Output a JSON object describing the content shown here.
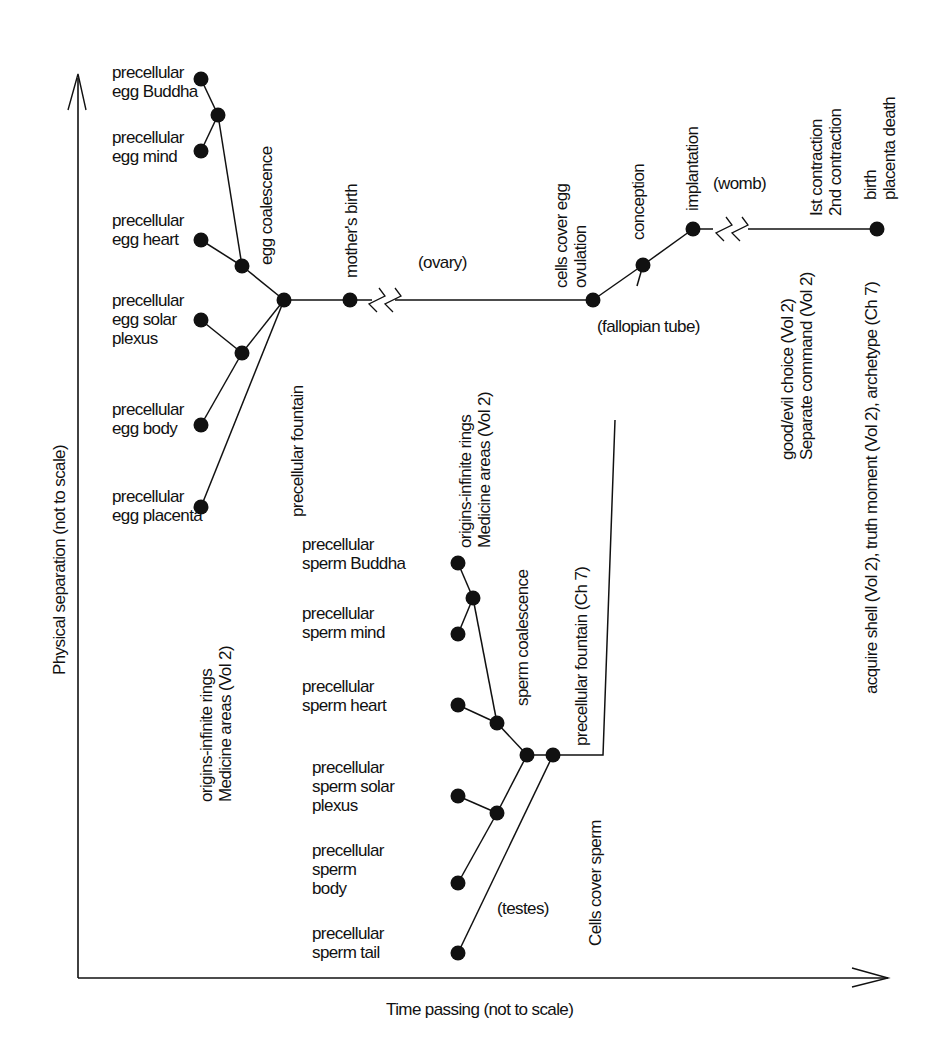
{
  "axes": {
    "y_label": "Physical separation (not to scale)",
    "x_label": "Time passing (not to scale)"
  },
  "nodes": [
    {
      "id": "eggBuddha",
      "x": 201,
      "y": 79
    },
    {
      "id": "eggM1",
      "x": 218,
      "y": 115
    },
    {
      "id": "eggMind",
      "x": 201,
      "y": 151
    },
    {
      "id": "eggHeart",
      "x": 201,
      "y": 240
    },
    {
      "id": "eggCoal",
      "x": 242,
      "y": 266
    },
    {
      "id": "eggFount",
      "x": 284,
      "y": 300
    },
    {
      "id": "eggSolar",
      "x": 201,
      "y": 320
    },
    {
      "id": "eggM2",
      "x": 242,
      "y": 353
    },
    {
      "id": "eggBody",
      "x": 201,
      "y": 425
    },
    {
      "id": "eggPlacenta",
      "x": 201,
      "y": 507
    },
    {
      "id": "mother",
      "x": 350,
      "y": 300
    },
    {
      "id": "ovulation",
      "x": 593,
      "y": 300
    },
    {
      "id": "conception",
      "x": 643,
      "y": 265
    },
    {
      "id": "implant",
      "x": 693,
      "y": 229
    },
    {
      "id": "birth",
      "x": 877,
      "y": 229
    },
    {
      "id": "spBuddha",
      "x": 458,
      "y": 563
    },
    {
      "id": "spM1",
      "x": 473,
      "y": 598
    },
    {
      "id": "spMind",
      "x": 458,
      "y": 634
    },
    {
      "id": "spHeart",
      "x": 458,
      "y": 705
    },
    {
      "id": "spCoal",
      "x": 497,
      "y": 723
    },
    {
      "id": "spA",
      "x": 527,
      "y": 755
    },
    {
      "id": "spB",
      "x": 553,
      "y": 755
    },
    {
      "id": "spSolar",
      "x": 458,
      "y": 796
    },
    {
      "id": "spM2",
      "x": 497,
      "y": 813
    },
    {
      "id": "spBody",
      "x": 458,
      "y": 883
    },
    {
      "id": "spTail",
      "x": 458,
      "y": 953
    }
  ],
  "edges": [
    [
      "eggBuddha",
      "eggM1"
    ],
    [
      "eggMind",
      "eggM1"
    ],
    [
      "eggM1",
      "eggCoal"
    ],
    [
      "eggHeart",
      "eggCoal"
    ],
    [
      "eggCoal",
      "eggFount"
    ],
    [
      "eggSolar",
      "eggM2"
    ],
    [
      "eggBody",
      "eggM2"
    ],
    [
      "eggM2",
      "eggFount"
    ],
    [
      "eggPlacenta",
      "eggFount"
    ],
    [
      "eggFount",
      "mother"
    ],
    [
      "ovulation",
      "conception"
    ],
    [
      "conception",
      "implant"
    ],
    [
      "spBuddha",
      "spM1"
    ],
    [
      "spMind",
      "spM1"
    ],
    [
      "spM1",
      "spCoal"
    ],
    [
      "spHeart",
      "spCoal"
    ],
    [
      "spCoal",
      "spA"
    ],
    [
      "spSolar",
      "spM2"
    ],
    [
      "spBody",
      "spM2"
    ],
    [
      "spM2",
      "spA"
    ],
    [
      "spA",
      "spB"
    ],
    [
      "spTail",
      "spB"
    ]
  ],
  "polylines": [
    {
      "name": "ovary-line",
      "points": "350,300 372,300"
    },
    {
      "name": "ovary-line-2",
      "points": "395,300 593,300"
    },
    {
      "name": "womb-line",
      "points": "693,229 713,229"
    },
    {
      "name": "womb-line-2",
      "points": "748,229 877,229"
    },
    {
      "name": "sperm-to-conception",
      "points": "553,755 603,755 615,420"
    },
    {
      "name": "fallopian-to-conception",
      "points": "637,286 643,265"
    }
  ],
  "labels_h": [
    {
      "x": 112,
      "y": 78,
      "lines": [
        "precellular",
        "egg Buddha"
      ]
    },
    {
      "x": 112,
      "y": 143,
      "lines": [
        "precellular",
        "egg mind"
      ]
    },
    {
      "x": 112,
      "y": 226,
      "lines": [
        "precellular",
        "egg heart"
      ]
    },
    {
      "x": 112,
      "y": 306,
      "lines": [
        "precellular",
        "egg solar",
        "plexus"
      ]
    },
    {
      "x": 112,
      "y": 415,
      "lines": [
        "precellular",
        "egg body"
      ]
    },
    {
      "x": 112,
      "y": 502,
      "lines": [
        "precellular",
        "egg placenta"
      ]
    },
    {
      "x": 418,
      "y": 268,
      "lines": [
        "(ovary)"
      ]
    },
    {
      "x": 597,
      "y": 332,
      "lines": [
        "(fallopian tube)"
      ]
    },
    {
      "x": 713,
      "y": 189,
      "lines": [
        "(womb)"
      ]
    },
    {
      "x": 302,
      "y": 550,
      "lines": [
        "precellular",
        "sperm Buddha"
      ]
    },
    {
      "x": 302,
      "y": 619,
      "lines": [
        "precellular",
        "sperm mind"
      ]
    },
    {
      "x": 302,
      "y": 692,
      "lines": [
        "precellular",
        "sperm heart"
      ]
    },
    {
      "x": 312,
      "y": 773,
      "lines": [
        "precellular",
        "sperm solar",
        "plexus"
      ]
    },
    {
      "x": 312,
      "y": 856,
      "lines": [
        "precellular",
        "sperm",
        "body"
      ]
    },
    {
      "x": 312,
      "y": 939,
      "lines": [
        "precellular",
        "sperm tail"
      ]
    },
    {
      "x": 497,
      "y": 914,
      "lines": [
        "(testes)"
      ]
    }
  ],
  "labels_v": [
    {
      "x": 272,
      "y": 265,
      "lines": [
        "egg coalescence"
      ]
    },
    {
      "x": 357,
      "y": 278,
      "lines": [
        "mother's birth"
      ]
    },
    {
      "x": 303,
      "y": 517,
      "lines": [
        "precellular fountain"
      ]
    },
    {
      "x": 212,
      "y": 802,
      "lines": [
        "origins-infinite rings",
        "Medicine areas (Vol 2)"
      ]
    },
    {
      "x": 567,
      "y": 288,
      "lines": [
        "cells cover egg",
        "ovulation"
      ]
    },
    {
      "x": 644,
      "y": 240,
      "lines": [
        "conception"
      ]
    },
    {
      "x": 698,
      "y": 211,
      "lines": [
        "implantation"
      ]
    },
    {
      "x": 822,
      "y": 216,
      "lines": [
        "Ist contraction",
        "2nd contraction"
      ]
    },
    {
      "x": 876,
      "y": 200,
      "lines": [
        "birth",
        "placenta death"
      ]
    },
    {
      "x": 793,
      "y": 460,
      "lines": [
        "good/evil choice (Vol 2)",
        "Separate command (Vol 2)"
      ]
    },
    {
      "x": 877,
      "y": 694,
      "lines": [
        "acquire shell (Vol 2), truth moment (Vol 2), archetype (Ch 7)"
      ]
    },
    {
      "x": 471,
      "y": 548,
      "lines": [
        "origins-infinite rings",
        "Medicine areas (Vol 2)"
      ]
    },
    {
      "x": 528,
      "y": 706,
      "lines": [
        "sperm coalescence"
      ]
    },
    {
      "x": 587,
      "y": 746,
      "lines": [
        "precellular fountain (Ch 7)"
      ]
    },
    {
      "x": 601,
      "y": 946,
      "lines": [
        "Cells cover sperm"
      ]
    }
  ],
  "breaks": [
    {
      "name": "ovary-break",
      "x": 383,
      "y": 300
    },
    {
      "name": "womb-break",
      "x": 730,
      "y": 229
    }
  ],
  "colors": {
    "ink": "#111111",
    "background": "#ffffff"
  }
}
